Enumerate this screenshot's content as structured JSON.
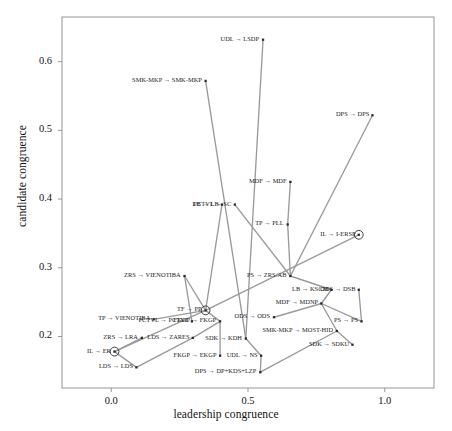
{
  "chart_data": {
    "type": "scatter",
    "title": "",
    "xlabel": "leadership congruence",
    "ylabel": "candidate congruence",
    "xlim": [
      -0.18,
      1.18
    ],
    "ylim": [
      0.125,
      0.665
    ],
    "xticks": [
      "0.0",
      "0.5",
      "1.0"
    ],
    "xtickvals": [
      0.0,
      0.5,
      1.0
    ],
    "yticks": [
      "0.2",
      "0.3",
      "0.4",
      "0.5",
      "0.6"
    ],
    "ytickvals": [
      0.2,
      0.3,
      0.4,
      0.5,
      0.6
    ],
    "grid": false,
    "legend": null,
    "points": [
      {
        "label": "UDL → LSDP",
        "x": 0.555,
        "y": 0.632,
        "circled": false,
        "label_anchor": "right"
      },
      {
        "label": "SMK-MKP → SMK-MKP",
        "x": 0.345,
        "y": 0.572,
        "circled": false,
        "label_anchor": "right"
      },
      {
        "label": "DPS → DPS",
        "x": 0.955,
        "y": 0.522,
        "circled": false,
        "label_anchor": "right"
      },
      {
        "label": "MDF → MDF",
        "x": 0.655,
        "y": 0.425,
        "circled": false,
        "label_anchor": "right"
      },
      {
        "label": "LB → LB",
        "x": 0.405,
        "y": 0.392,
        "circled": false,
        "label_anchor": "right"
      },
      {
        "label": "PCTVL → SC",
        "x": 0.452,
        "y": 0.392,
        "circled": false,
        "label_anchor": "right"
      },
      {
        "label": "TP → PLL",
        "x": 0.645,
        "y": 0.363,
        "circled": false,
        "label_anchor": "right"
      },
      {
        "label": "IL → I-ERSP",
        "x": 0.905,
        "y": 0.348,
        "circled": true,
        "label_anchor": "right"
      },
      {
        "label": "ZRS → VIENOTIBA",
        "x": 0.268,
        "y": 0.288,
        "circled": false,
        "label_anchor": "right"
      },
      {
        "label": "PS → ZRS/AB",
        "x": 0.655,
        "y": 0.288,
        "circled": false,
        "label_anchor": "right"
      },
      {
        "label": "LB → KSCM",
        "x": 0.805,
        "y": 0.268,
        "circled": false,
        "label_anchor": "right"
      },
      {
        "label": "ODS → DSB",
        "x": 0.905,
        "y": 0.268,
        "circled": false,
        "label_anchor": "right"
      },
      {
        "label": "MDF → MDNP",
        "x": 0.768,
        "y": 0.248,
        "circled": false,
        "label_anchor": "right"
      },
      {
        "label": "TF → PP",
        "x": 0.345,
        "y": 0.238,
        "circled": true,
        "label_anchor": "right"
      },
      {
        "label": "ODS → ODS",
        "x": 0.595,
        "y": 0.228,
        "circled": false,
        "label_anchor": "right"
      },
      {
        "label": "TP → VIENOTIBA",
        "x": 0.155,
        "y": 0.225,
        "circled": false,
        "label_anchor": "right"
      },
      {
        "label": "PCTVL → PCTVL",
        "x": 0.295,
        "y": 0.222,
        "circled": false,
        "label_anchor": "right"
      },
      {
        "label": "FKGP → FKGP",
        "x": 0.398,
        "y": 0.222,
        "circled": false,
        "label_anchor": "right"
      },
      {
        "label": "PS → PS",
        "x": 0.915,
        "y": 0.222,
        "circled": false,
        "label_anchor": "right"
      },
      {
        "label": "SMK-MKP → MOST-HID",
        "x": 0.825,
        "y": 0.208,
        "circled": false,
        "label_anchor": "right"
      },
      {
        "label": "ZRS → LRA",
        "x": 0.112,
        "y": 0.198,
        "circled": false,
        "label_anchor": "right"
      },
      {
        "label": "LDS → ZARES",
        "x": 0.298,
        "y": 0.198,
        "circled": false,
        "label_anchor": "right"
      },
      {
        "label": "SDK → KDH",
        "x": 0.492,
        "y": 0.197,
        "circled": false,
        "label_anchor": "right"
      },
      {
        "label": "SDK → SDKU",
        "x": 0.882,
        "y": 0.188,
        "circled": false,
        "label_anchor": "right"
      },
      {
        "label": "IL → ER",
        "x": 0.012,
        "y": 0.178,
        "circled": true,
        "label_anchor": "right"
      },
      {
        "label": "FKGP → EKGP",
        "x": 0.398,
        "y": 0.172,
        "circled": false,
        "label_anchor": "right"
      },
      {
        "label": "UDL → NS",
        "x": 0.548,
        "y": 0.172,
        "circled": false,
        "label_anchor": "right"
      },
      {
        "label": "LDS → LDS",
        "x": 0.092,
        "y": 0.155,
        "circled": false,
        "label_anchor": "right"
      },
      {
        "label": "DPS → DP+KDS+LZP",
        "x": 0.545,
        "y": 0.148,
        "circled": false,
        "label_anchor": "right"
      }
    ],
    "connectors": [
      {
        "from": [
          0.555,
          0.632
        ],
        "to": [
          0.492,
          0.197
        ]
      },
      {
        "from": [
          0.345,
          0.572
        ],
        "to": [
          0.492,
          0.197
        ]
      },
      {
        "from": [
          0.955,
          0.522
        ],
        "to": [
          0.655,
          0.288
        ]
      },
      {
        "from": [
          0.655,
          0.425
        ],
        "to": [
          0.645,
          0.363
        ]
      },
      {
        "from": [
          0.645,
          0.363
        ],
        "to": [
          0.655,
          0.288
        ]
      },
      {
        "from": [
          0.452,
          0.392
        ],
        "to": [
          0.655,
          0.288
        ]
      },
      {
        "from": [
          0.405,
          0.392
        ],
        "to": [
          0.345,
          0.238
        ]
      },
      {
        "from": [
          0.905,
          0.348
        ],
        "to": [
          0.345,
          0.238
        ]
      },
      {
        "from": [
          0.268,
          0.288
        ],
        "to": [
          0.345,
          0.238
        ]
      },
      {
        "from": [
          0.805,
          0.268
        ],
        "to": [
          0.768,
          0.248
        ]
      },
      {
        "from": [
          0.905,
          0.268
        ],
        "to": [
          0.915,
          0.222
        ]
      },
      {
        "from": [
          0.768,
          0.248
        ],
        "to": [
          0.915,
          0.222
        ]
      },
      {
        "from": [
          0.768,
          0.248
        ],
        "to": [
          0.825,
          0.208
        ]
      },
      {
        "from": [
          0.345,
          0.238
        ],
        "to": [
          0.155,
          0.225
        ]
      },
      {
        "from": [
          0.345,
          0.238
        ],
        "to": [
          0.012,
          0.178
        ]
      },
      {
        "from": [
          0.112,
          0.198
        ],
        "to": [
          0.012,
          0.178
        ]
      },
      {
        "from": [
          0.012,
          0.178
        ],
        "to": [
          0.092,
          0.155
        ]
      },
      {
        "from": [
          0.092,
          0.155
        ],
        "to": [
          0.298,
          0.198
        ]
      },
      {
        "from": [
          0.298,
          0.198
        ],
        "to": [
          0.398,
          0.222
        ]
      },
      {
        "from": [
          0.398,
          0.222
        ],
        "to": [
          0.345,
          0.238
        ]
      },
      {
        "from": [
          0.398,
          0.222
        ],
        "to": [
          0.398,
          0.172
        ]
      },
      {
        "from": [
          0.492,
          0.197
        ],
        "to": [
          0.548,
          0.172
        ]
      },
      {
        "from": [
          0.548,
          0.172
        ],
        "to": [
          0.545,
          0.148
        ]
      },
      {
        "from": [
          0.545,
          0.148
        ],
        "to": [
          0.825,
          0.208
        ]
      },
      {
        "from": [
          0.882,
          0.188
        ],
        "to": [
          0.825,
          0.208
        ]
      },
      {
        "from": [
          0.595,
          0.228
        ],
        "to": [
          0.768,
          0.248
        ]
      },
      {
        "from": [
          0.655,
          0.288
        ],
        "to": [
          0.805,
          0.268
        ]
      },
      {
        "from": [
          0.295,
          0.222
        ],
        "to": [
          0.268,
          0.288
        ]
      }
    ],
    "style": {
      "point_color": "#2b2b2b",
      "connector_color": "#9a9a9a",
      "frame_color": "#8c8c8c",
      "background": "#ffffff"
    }
  }
}
